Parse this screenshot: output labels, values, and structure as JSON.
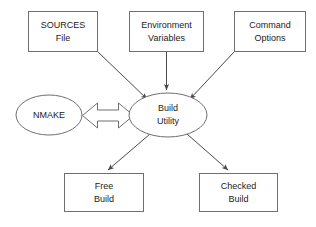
{
  "diagram": {
    "type": "flow-diagram",
    "canvas": {
      "width": 316,
      "height": 227,
      "background": "#ffffff"
    },
    "style": {
      "shape_stroke": "#6f6f6f",
      "shape_fill": "#ffffff",
      "edge_stroke": "#4a4a4a",
      "text_color": "#1b1b1b"
    },
    "nodes": [
      {
        "id": "sources-file",
        "shape": "rectangle",
        "line1": "SOURCES",
        "line2": "File",
        "x": 28,
        "y": 11,
        "w": 69,
        "h": 40
      },
      {
        "id": "environment-variables",
        "shape": "rectangle",
        "line1": "Environment",
        "line2": "Variables",
        "x": 129,
        "y": 11,
        "w": 74,
        "h": 40
      },
      {
        "id": "command-options",
        "shape": "rectangle",
        "line1": "Command",
        "line2": "Options",
        "x": 234,
        "y": 11,
        "w": 72,
        "h": 40
      },
      {
        "id": "nmake",
        "shape": "ellipse",
        "line1": "NMAKE",
        "line2": "",
        "cx": 49,
        "cy": 115,
        "rx": 33,
        "ry": 20
      },
      {
        "id": "build-utility",
        "shape": "ellipse",
        "line1": "Build",
        "line2": "Utility",
        "cx": 168,
        "cy": 115,
        "rx": 39,
        "ry": 22
      },
      {
        "id": "free-build",
        "shape": "rectangle",
        "line1": "Free",
        "line2": "Build",
        "x": 64,
        "y": 173,
        "w": 80,
        "h": 39
      },
      {
        "id": "checked-build",
        "shape": "rectangle",
        "line1": "Checked",
        "line2": "Build",
        "x": 199,
        "y": 173,
        "w": 79,
        "h": 39
      }
    ],
    "edges": [
      {
        "id": "sources-to-build",
        "from": "sources-file",
        "to": "build-utility",
        "style": "arrow",
        "direction": "one-way"
      },
      {
        "id": "environment-to-build",
        "from": "environment-variables",
        "to": "build-utility",
        "style": "arrow",
        "direction": "one-way"
      },
      {
        "id": "command-to-build",
        "from": "command-options",
        "to": "build-utility",
        "style": "arrow",
        "direction": "one-way"
      },
      {
        "id": "nmake-build-exchange",
        "from": "nmake",
        "to": "build-utility",
        "style": "block-arrow",
        "direction": "two-way"
      },
      {
        "id": "build-to-free",
        "from": "build-utility",
        "to": "free-build",
        "style": "arrow",
        "direction": "one-way"
      },
      {
        "id": "build-to-checked",
        "from": "build-utility",
        "to": "checked-build",
        "style": "arrow",
        "direction": "one-way"
      }
    ]
  }
}
